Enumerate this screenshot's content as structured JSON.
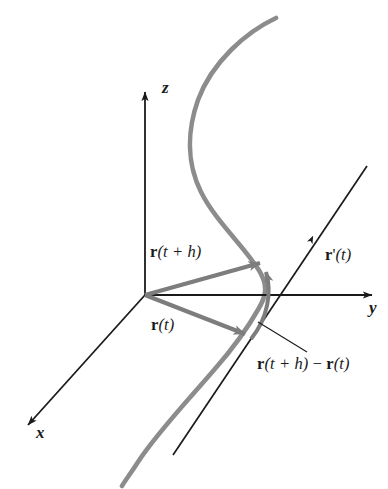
{
  "figure": {
    "background_color": "#ffffff",
    "curve_color": "#8c8c8c",
    "axis_color": "#1a1a1a",
    "vector_color": "#7d7d7d",
    "text_color": "#1a1a1a",
    "width": 388,
    "height": 489
  },
  "axes": [
    {
      "name": "z-axis",
      "label": "z",
      "direction": "up",
      "origin": [
        145,
        295
      ],
      "tip": [
        145,
        88
      ]
    },
    {
      "name": "y-axis",
      "label": "y",
      "direction": "right",
      "origin": [
        145,
        295
      ],
      "tip": [
        377,
        295
      ]
    },
    {
      "name": "x-axis",
      "label": "x",
      "direction": "down-left",
      "origin": [
        145,
        295
      ],
      "tip": [
        23,
        430
      ]
    }
  ],
  "labels": {
    "z": "z",
    "y": "y",
    "x": "x",
    "r_t_plus_h": {
      "bold": "r",
      "rest": "(t + h)"
    },
    "r_t": {
      "bold": "r",
      "rest": "(t)"
    },
    "r_prime_t": {
      "bold": "r",
      "prime": "'",
      "rest": "(t)"
    },
    "difference": {
      "bold1": "r",
      "part1": "(t + h)",
      "minus": " − ",
      "bold2": "r",
      "part2": "(t)"
    }
  },
  "vectors": [
    {
      "name": "r(t+h)",
      "from": [
        145,
        295
      ],
      "to": [
        266,
        261
      ],
      "style": "thick-gray-arrow"
    },
    {
      "name": "r(t)",
      "from": [
        145,
        295
      ],
      "to": [
        251,
        337
      ],
      "style": "thick-gray-arrow"
    },
    {
      "name": "r(t+h)-r(t)",
      "from": [
        251,
        337
      ],
      "to": [
        266,
        263
      ],
      "style": "thick-gray-curved-arrow"
    },
    {
      "name": "r'(t)",
      "from": [
        246,
        334
      ],
      "to": [
        367,
        166
      ],
      "style": "thin-black-line-with-arrow"
    }
  ],
  "curve": {
    "name": "space-curve-C",
    "description": "gray S-shaped space curve passing through the two vector tips",
    "points": [
      [
        276,
        18
      ],
      [
        232,
        48
      ],
      [
        197,
        96
      ],
      [
        189,
        150
      ],
      [
        206,
        196
      ],
      [
        238,
        238
      ],
      [
        262,
        272
      ],
      [
        258,
        305
      ],
      [
        243,
        341
      ],
      [
        203,
        383
      ],
      [
        160,
        429
      ],
      [
        131,
        470
      ],
      [
        122,
        486
      ]
    ]
  },
  "leader_line": {
    "from": [
      258,
      322
    ],
    "to": [
      307,
      352
    ]
  }
}
